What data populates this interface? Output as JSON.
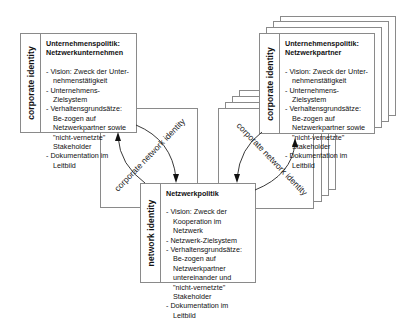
{
  "diagram": {
    "left_box": {
      "side_label": "corporate identity",
      "title_line1": "Unternehmenspolitik:",
      "title_line2": "Netzwerkunternehmen",
      "items": [
        "- Vision: Zweck der Unter-nehmenstätigkeit",
        "- Unternehmens-Zielsystem",
        "- Verhaltensgrundsätze: Be-zogen auf Netzwerkpartner sowie \"nicht-vernetzte\" Stakeholder",
        "- Dokumentation im Leitbild"
      ]
    },
    "right_box": {
      "side_label": "corporate identity",
      "title_line1": "Unternehmenspolitik:",
      "title_line2": "Netzwerkpartner",
      "items": [
        "- Vision: Zweck der Unter-nehmenstätigkeit",
        "- Unternehmens-Zielsystem",
        "- Verhaltensgrundsätze: Be-zogen auf Netzwerkpartner sowie \"nicht-vernetzte\" Stakeholder",
        "- Dokumentation im Leitbild"
      ],
      "stack_count": 3
    },
    "network_box": {
      "side_label": "network identity",
      "title": "Netzwerkpolitik",
      "items": [
        "- Vision: Zweck der Kooperation im Netzwerk",
        "- Netzwerk-Zielsystem",
        "- Verhaltensgrundsätze: Be-zogen auf Netzwerkpartner untereinander und \"nicht-vernetzte\" Stakeholder",
        "- Dokumentation im Leitbild"
      ]
    },
    "connectors": {
      "left_label": "corporate network identity",
      "right_label": "corporate network identity"
    },
    "colors": {
      "border": "#8a8a8a",
      "text": "#111111",
      "background": "#ffffff"
    }
  }
}
